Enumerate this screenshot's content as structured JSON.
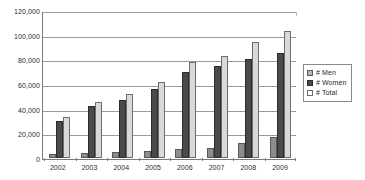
{
  "chart_data": {
    "type": "bar",
    "title": "",
    "xlabel": "",
    "ylabel": "",
    "categories": [
      "2002",
      "2003",
      "2004",
      "2005",
      "2006",
      "2007",
      "2008",
      "2009"
    ],
    "series": [
      {
        "name": "# Men",
        "color": "#8d8d8d",
        "values": [
          3000,
          4000,
          4500,
          5500,
          7500,
          8500,
          12500,
          17000
        ]
      },
      {
        "name": "# Women",
        "color": "#4a4a4a",
        "values": [
          30000,
          42000,
          47000,
          56000,
          69500,
          74500,
          80500,
          85000
        ]
      },
      {
        "name": "# Total",
        "color": "#d9d9d9",
        "values": [
          33000,
          45500,
          51500,
          62000,
          77500,
          83000,
          94000,
          103000
        ]
      }
    ],
    "ylim": [
      0,
      120000
    ],
    "yticks": [
      0,
      20000,
      40000,
      60000,
      80000,
      100000,
      120000
    ],
    "ytick_labels": [
      "0",
      "20,000",
      "40,000",
      "60,000",
      "80,000",
      "100,000",
      "120,000"
    ],
    "grid": true,
    "legend_position": "right"
  },
  "legend": {
    "items": [
      {
        "label": "# Men",
        "swatch": "men-swatch-icon"
      },
      {
        "label": "# Women",
        "swatch": "women-swatch-icon"
      },
      {
        "label": "# Total",
        "swatch": "total-swatch-icon"
      }
    ]
  }
}
